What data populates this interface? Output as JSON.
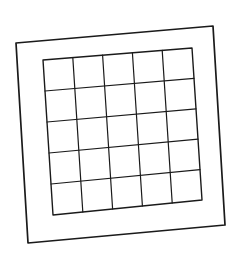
{
  "drawing": {
    "description": "Hand-drawn square frame containing a 5x5 grid",
    "stroke_color": "#1a1a1a",
    "background": "#ffffff",
    "outer_frame": {
      "tl": [
        16,
        43
      ],
      "tr": [
        213,
        26
      ],
      "br": [
        225,
        225
      ],
      "bl": [
        28,
        243
      ]
    },
    "inner_grid": {
      "tl": [
        43,
        60
      ],
      "tr": [
        192,
        48
      ],
      "br": [
        202,
        200
      ],
      "bl": [
        53,
        215
      ],
      "rows": 5,
      "cols": 5
    }
  }
}
